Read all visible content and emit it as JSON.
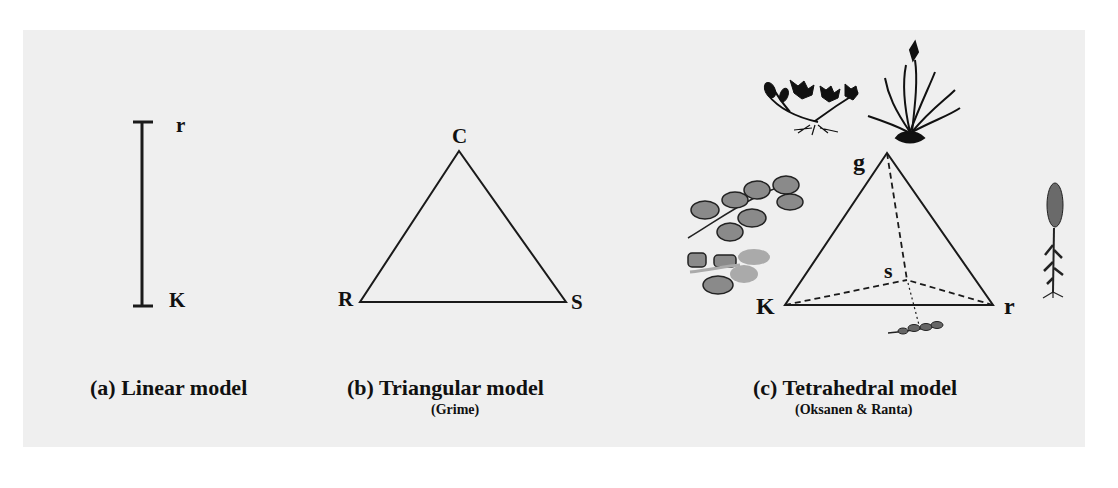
{
  "figure": {
    "background_color": "#efefef",
    "line_color": "#1a1a1a",
    "panels": [
      {
        "id": "linear",
        "caption": "(a) Linear model",
        "subcaption": "",
        "vertices": {
          "top": "r",
          "bottom": "K"
        }
      },
      {
        "id": "triangular",
        "caption": "(b) Triangular model",
        "subcaption": "(Grime)",
        "vertices": {
          "top": "C",
          "left": "R",
          "right": "S"
        }
      },
      {
        "id": "tetrahedral",
        "caption": "(c) Tetrahedral model",
        "subcaption": "(Oksanen & Ranta)",
        "vertices": {
          "top": "g",
          "left": "K",
          "right": "r",
          "back": "s"
        },
        "illustrations": [
          "rosette-plant-icon",
          "grass-tuft-icon",
          "leafy-vine-icon",
          "flowering-spike-plant-icon",
          "small-sprig-icon"
        ]
      }
    ]
  }
}
